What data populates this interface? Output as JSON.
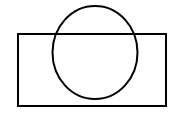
{
  "canvas": {
    "width": 178,
    "height": 118,
    "background_color": "#ffffff",
    "description": "Line drawing of a circle overlapping a rectangle"
  },
  "figure": {
    "title": "Circle overlapping rectangle",
    "stroke_color": "#000000",
    "fill_color": "none",
    "stroke_width": 2,
    "shapes": [
      {
        "id": "rectangle",
        "name": "rectangle",
        "type": "rect",
        "x": 18,
        "y": 34,
        "width": 148,
        "height": 72,
        "stroke_color": "#000000",
        "stroke_width": 2,
        "fill": "none"
      },
      {
        "id": "circle",
        "name": "circle",
        "type": "ellipse",
        "cx": 95,
        "cy": 52.5,
        "rx": 42.5,
        "ry": 46.5,
        "stroke_color": "#000000",
        "stroke_width": 2,
        "fill": "none"
      }
    ],
    "relations": {
      "overlap": "circle crosses the top edge of the rectangle",
      "circle_top_above_rectangle": true,
      "circle_bottom_inside_rectangle": true
    }
  }
}
